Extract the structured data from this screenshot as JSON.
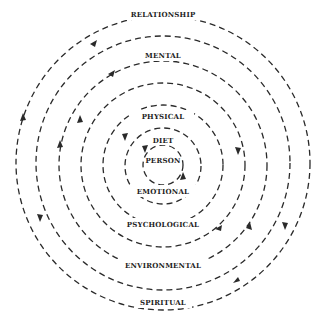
{
  "diagram": {
    "center": {
      "x": 163,
      "y": 163
    },
    "stroke_color": "#2a2a2a",
    "rings": [
      {
        "r": 20
      },
      {
        "r": 38
      },
      {
        "r": 58
      },
      {
        "r": 81
      },
      {
        "r": 105
      },
      {
        "r": 127
      },
      {
        "r": 147
      }
    ],
    "labels": {
      "person": "PERSON",
      "diet": "DIET",
      "physical": "PHYSICAL",
      "mental": "MENTAL",
      "relationship": "RELATIONSHIP",
      "emotional": "EMOTIONAL",
      "psychological": "PSYCHOLOGICAL",
      "environmental": "ENVIRONMENTAL",
      "spiritual": "SPIRITUAL"
    }
  }
}
